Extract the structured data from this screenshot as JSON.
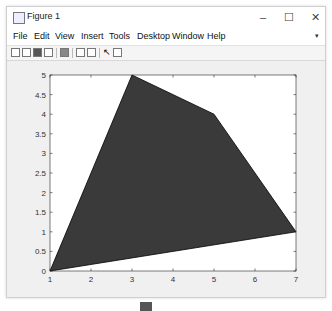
{
  "window": {
    "title": "Figure 1",
    "controls": {
      "minimize": "–",
      "maximize": "☐",
      "close": "✕"
    }
  },
  "menubar": {
    "items": [
      {
        "label": "File"
      },
      {
        "label": "Edit"
      },
      {
        "label": "View"
      },
      {
        "label": "Insert"
      },
      {
        "label": "Tools"
      },
      {
        "label": "Desktop"
      },
      {
        "label": "Window"
      },
      {
        "label": "Help"
      }
    ],
    "overflow_arrow": "▾"
  },
  "toolbar": {
    "icons": [
      "new-figure-icon",
      "open-file-icon",
      "save-icon",
      "print-icon",
      "print-preview-icon",
      "link-plot-icon",
      "insert-colorbar-icon",
      "pointer-icon",
      "property-inspector-icon"
    ]
  },
  "colors": {
    "polygon_fill": "#3a3a3a",
    "polygon_edge": "#000000",
    "axes_bg": "#ffffff",
    "figure_bg": "#f0f0f0"
  },
  "chart_data": {
    "type": "area",
    "subtype": "filled-polygon",
    "title": "",
    "xlabel": "",
    "ylabel": "",
    "xlim": [
      1,
      7
    ],
    "ylim": [
      0,
      5
    ],
    "xticks": [
      "1",
      "2",
      "3",
      "4",
      "5",
      "6",
      "7"
    ],
    "yticks": [
      "0",
      "0.5",
      "1",
      "1.5",
      "2",
      "2.5",
      "3",
      "3.5",
      "4",
      "4.5",
      "5"
    ],
    "grid": false,
    "legend": null,
    "series": [
      {
        "name": "polygon",
        "x": [
          1,
          3,
          5,
          7
        ],
        "y": [
          0,
          5,
          4,
          1
        ]
      }
    ]
  }
}
